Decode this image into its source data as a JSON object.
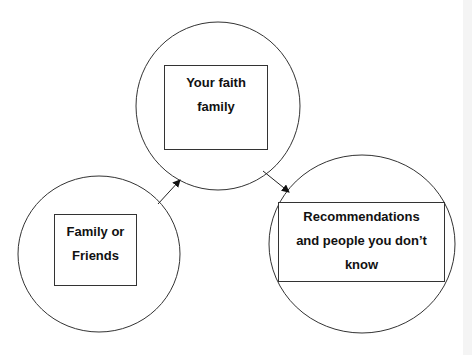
{
  "diagram": {
    "nodes": [
      {
        "id": "family-friends",
        "lines": [
          "Family or",
          "Friends"
        ]
      },
      {
        "id": "faith-family",
        "lines": [
          "Your faith",
          "family"
        ]
      },
      {
        "id": "recommendations",
        "lines": [
          "Recommendations",
          "and people you don’t",
          "know"
        ]
      }
    ],
    "edges": [
      {
        "from": "family-friends",
        "to": "faith-family"
      },
      {
        "from": "faith-family",
        "to": "recommendations"
      }
    ],
    "colors": {
      "stroke": "#333333",
      "text": "#111111",
      "background": "#ffffff"
    }
  }
}
